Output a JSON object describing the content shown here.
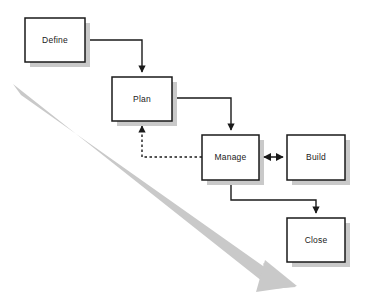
{
  "diagram": {
    "type": "process-flow-diagram",
    "background_color": "#ffffff",
    "box_fill_color": "#ffffff",
    "box_border_color": "#1a1a1a",
    "box_shadow_color": "#c9c9c9",
    "connector_color": "#1a1a1a",
    "timeline_arrow_color": "#c9c9c9",
    "nodes": [
      {
        "id": "define",
        "label": "Define",
        "x": 25,
        "y": 18,
        "width": 60,
        "height": 44
      },
      {
        "id": "plan",
        "label": "Plan",
        "x": 112,
        "y": 77,
        "width": 60,
        "height": 44
      },
      {
        "id": "manage",
        "label": "Manage",
        "x": 202,
        "y": 135,
        "width": 57,
        "height": 45
      },
      {
        "id": "build",
        "label": "Build",
        "x": 287,
        "y": 135,
        "width": 58,
        "height": 45
      },
      {
        "id": "close",
        "label": "Close",
        "x": 287,
        "y": 218,
        "width": 58,
        "height": 44
      }
    ],
    "connectors": [
      {
        "id": "define-to-plan",
        "from": "define",
        "to": "plan",
        "style": "solid",
        "arrowheads": "end",
        "path": "M 85 40 L 142 40 L 142 72"
      },
      {
        "id": "plan-to-manage",
        "from": "plan",
        "to": "manage",
        "style": "solid",
        "arrowheads": "end",
        "path": "M 172 98 L 231 98 L 231 130"
      },
      {
        "id": "manage-to-plan-feedback",
        "from": "manage",
        "to": "plan",
        "style": "dashed",
        "arrowheads": "end",
        "path": "M 202 157 L 142 157 L 142 126"
      },
      {
        "id": "manage-to-build",
        "from": "manage",
        "to": "build",
        "style": "solid",
        "arrowheads": "both",
        "path": "M 263 157 L 283 157"
      },
      {
        "id": "manage-to-close",
        "from": "manage",
        "to": "close",
        "style": "solid",
        "arrowheads": "end",
        "path": "M 231 180 L 231 200 L 316 200 L 316 213"
      }
    ],
    "timeline_arrow": {
      "id": "time-direction-arrow",
      "label": "",
      "start_x": 16,
      "start_y": 90,
      "end_x": 292,
      "end_y": 286,
      "thickness": 13
    }
  }
}
